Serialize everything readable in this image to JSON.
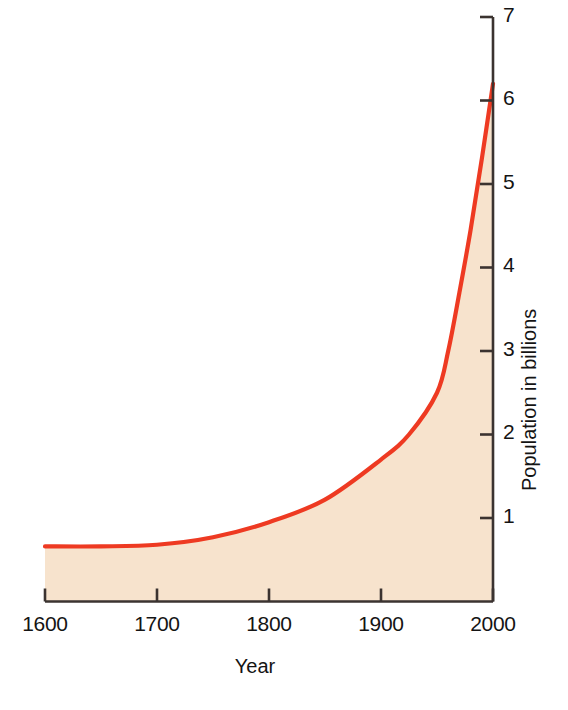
{
  "figure": {
    "background_color": "#ffffff",
    "line_color": "#ee3a22",
    "fill_color": "#f7e3cd",
    "axis_color": "#3b3330"
  },
  "axes": {
    "x": {
      "label": "Year",
      "ticks": [
        "1600",
        "1700",
        "1800",
        "1900",
        "2000"
      ],
      "range": [
        1600,
        2000
      ]
    },
    "y": {
      "label": "Population in billions",
      "ticks": [
        "1",
        "2",
        "3",
        "4",
        "5",
        "6",
        "7"
      ],
      "range": [
        0,
        7
      ],
      "side": "right"
    }
  },
  "chart_data": {
    "type": "area",
    "title": "",
    "subtitle": "",
    "xlabel": "Year",
    "ylabel": "Population in billions",
    "xlim": [
      1600,
      2000
    ],
    "ylim": [
      0,
      7
    ],
    "xticks": [
      1600,
      1700,
      1800,
      1900,
      2000
    ],
    "yticks": [
      1,
      2,
      3,
      4,
      5,
      6,
      7
    ],
    "grid": false,
    "legend": "none",
    "series": [
      {
        "name": "World population",
        "line_color": "#ee3a22",
        "fill_color": "#f7e3cd",
        "x": [
          1600,
          1650,
          1700,
          1750,
          1800,
          1850,
          1900,
          1925,
          1950,
          1960,
          1970,
          1980,
          1990,
          2000
        ],
        "values": [
          0.66,
          0.66,
          0.68,
          0.77,
          0.95,
          1.22,
          1.7,
          2.0,
          2.5,
          3.0,
          3.7,
          4.45,
          5.3,
          6.2
        ]
      }
    ]
  }
}
